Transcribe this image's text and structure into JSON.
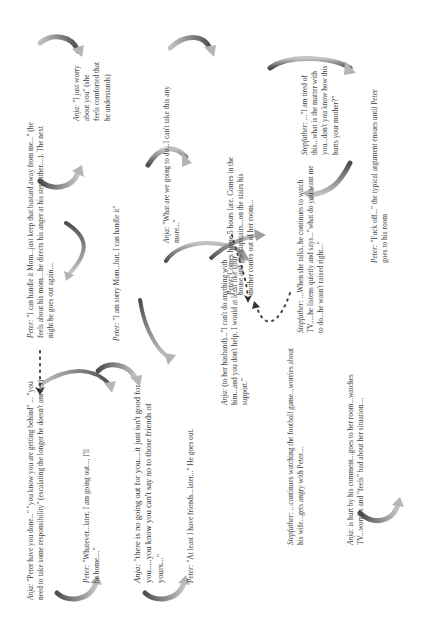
{
  "diagram": {
    "type": "interaction-cycle",
    "orientation": "rotated-90-ccw",
    "nodes": [
      {
        "id": "n1",
        "speaker": "Anja:",
        "text": " \"Peter have you done...\" \"you know you are getting behind\" ... \"you need to take some responsibility\" (escalating the longer he doesn't answer)"
      },
      {
        "id": "n2",
        "speaker": "Peter:",
        "text": " \"Whatever...later, I am going out..., I'll be home....\""
      },
      {
        "id": "n3",
        "speaker": "Anja:",
        "text": " \"there is no going out for you....it just isn't good for you.....you know you can't say no to those friends of yours...\""
      },
      {
        "id": "n4",
        "speaker": "Peter:",
        "text": " \"At least I have friends...later...\" He goes out."
      },
      {
        "id": "n5",
        "speaker": "Anja:",
        "text": " (to her husband)...\"I can't do anything with him...and you don't help. I would at least like your support.\""
      },
      {
        "id": "n6",
        "speaker": "Stepfather:",
        "text": " ...continues watching the football game...worries about his wife...gets angry with Peter...."
      },
      {
        "id": "n7",
        "speaker": "Anja:",
        "text": "  is hurt by his comment...goes to her room...watches TV...worries and \"feels\" bad about her situation...."
      },
      {
        "id": "n8",
        "speaker": "Peter:",
        "text": " \"I can handle it Mom...just keep that bastard away from me...\" (he feels about his mom....he directs his anger at his stepfather....).  The next night he goes out again...."
      },
      {
        "id": "n9",
        "speaker": "Peter:",
        "text": " \"I am sorry Mom...but, I can handle it\""
      },
      {
        "id": "n10",
        "speaker": "Anja:",
        "text": " \"I just worry about you\" (she feels comforted that he understands)"
      },
      {
        "id": "n11",
        "speaker": "Anja:",
        "text": " \"What are we going to do...I can't take this any more...\""
      },
      {
        "id": "n12",
        "speaker": "Peter:",
        "text": " Comes home 5 hours late. Comes in the house and goes upstairs...on the stairs his mother comes out of her room..."
      },
      {
        "id": "n13",
        "speaker": "Stepfather:",
        "text": " ...When she talks, he continues to watch TV.....he listens quietly and says...\"what do you want me to do...he wasn't raised right...\""
      },
      {
        "id": "n14",
        "speaker": "Stepfather:",
        "text": " ...\"I am tired of this...what is the matter with you...don't you know how this hurts your mother?\""
      },
      {
        "id": "n15",
        "speaker": "Peter:",
        "text": " \"Fuck off...\" the typical argument ensues until Peter goes to his room"
      }
    ],
    "colors": {
      "arrow_dark": "#555555",
      "arrow_light": "#bdbdbd",
      "text": "#444444",
      "background": "#ffffff"
    }
  }
}
